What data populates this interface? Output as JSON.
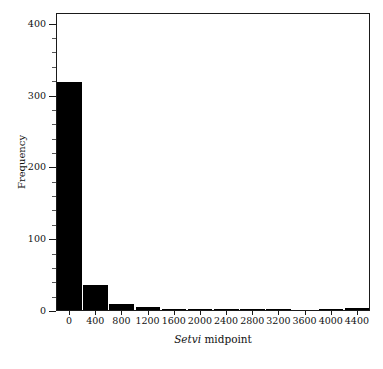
{
  "chart_data": {
    "type": "bar",
    "title": "",
    "subtitle": "",
    "xlabel_italic": "Setvi",
    "xlabel_rest": " midpoint",
    "xlabel": "Setvi midpoint",
    "ylabel": "Frequency",
    "categories": [
      0,
      400,
      800,
      1200,
      1600,
      2000,
      2400,
      2800,
      3200,
      3600,
      4000,
      4400
    ],
    "values": [
      317,
      35,
      9,
      4,
      2,
      2,
      2,
      2,
      1,
      0,
      2,
      3
    ],
    "bin_width": 400,
    "xlim": [
      -200,
      4600
    ],
    "ylim": [
      0,
      415
    ],
    "xticks": [
      0,
      400,
      800,
      1200,
      1600,
      2000,
      2400,
      2800,
      3200,
      3600,
      4000,
      4400
    ],
    "xtick_labels": [
      "0",
      "400",
      "800",
      "1200",
      "1600",
      "2000",
      "2400",
      "2800",
      "3200",
      "3600",
      "4000",
      "4400"
    ],
    "yticks": [
      0,
      100,
      200,
      300,
      400
    ],
    "ytick_labels": [
      "0",
      "100",
      "200",
      "300",
      "400"
    ],
    "y_minor_step": 20,
    "grid": false,
    "legend": null,
    "bar_color": "#000000",
    "background_color": "#ffffff",
    "frame_color": "#1a1a1a"
  }
}
